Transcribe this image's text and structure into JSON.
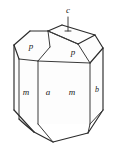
{
  "figure": {
    "background_color": "#ffffff",
    "line_color": "#2b2b2b"
  },
  "labels": {
    "c": "c",
    "p_left": "p",
    "p_right": "p",
    "m_left": "m",
    "a": "a",
    "m_right": "m",
    "b": "b"
  }
}
